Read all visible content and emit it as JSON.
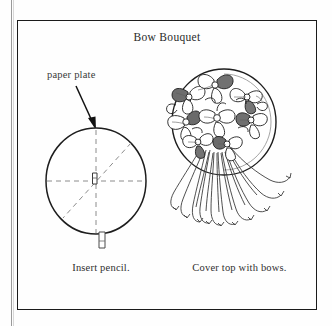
{
  "page": {
    "title": "Bow Bouquet",
    "background_color": "#fefefe",
    "ink_color": "#1b1b1b"
  },
  "frame": {
    "border_color": "#1b1b1b"
  },
  "annotations": {
    "paper_plate_label": "paper plate",
    "arrow_icon": "arrow-down-right-icon"
  },
  "figures": {
    "left": {
      "name": "paper-plate-with-pencil",
      "caption": "Insert pencil.",
      "elements": [
        "paper plate circle",
        "dashed fold lines",
        "pencil through center",
        "pencil tip below plate"
      ]
    },
    "right": {
      "name": "bow-bouquet-on-plate",
      "caption": "Cover top with bows.",
      "elements": [
        "paper plate circle",
        "cluster of ribbon bows",
        "trailing curled ribbon streamers"
      ]
    }
  }
}
